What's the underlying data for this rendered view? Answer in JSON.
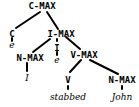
{
  "tree": {
    "nodes": {
      "cmax": "C-MAX",
      "c": "C",
      "c_e": "e",
      "imax": "I-MAX",
      "nmax1": "N-MAX",
      "nmax1_word": "I",
      "i": "I",
      "i_e": "e",
      "vmax": "V-MAX",
      "v": "V",
      "v_word": "stabbed",
      "nmax2": "N-MAX",
      "nmax2_word": "John"
    }
  }
}
